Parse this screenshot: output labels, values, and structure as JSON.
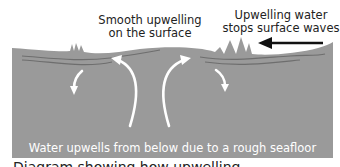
{
  "diagram": {
    "labels": {
      "smooth_line1": "Smooth upwelling",
      "smooth_line2": "on the surface",
      "stops_line1": "Upwelling water",
      "stops_line2": "stops surface waves",
      "bottom": "Water upwells from below due to a rough seafloor"
    },
    "caption": "Diagram showing how upwelling",
    "colors": {
      "water": "#9a9a9a",
      "water_lines": "#6e6e6e",
      "arrows": "#ffffff",
      "wind_arrow": "#111111",
      "text": "#222222",
      "background": "#ffffff"
    },
    "elements": {
      "upwelling_arrows": 2,
      "downwelling_arrows": 2,
      "wind_arrow_direction": "left"
    }
  }
}
